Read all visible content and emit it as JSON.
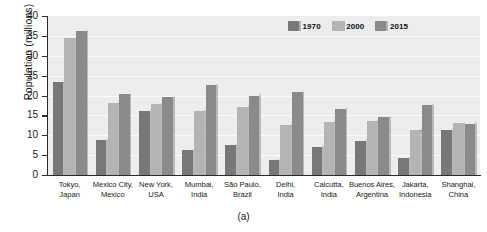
{
  "caption": "(a)",
  "colors": {
    "series_1970": "#787878",
    "series_2000": "#b4b4b4",
    "series_2015": "#8a8a8a",
    "plot_background": "#eceded",
    "gridline": "#fbfbfb",
    "axis": "#2a2a2a",
    "text": "#1a1a1a"
  },
  "chart_data": {
    "type": "bar",
    "title": "",
    "subtitle": "",
    "xlabel": "",
    "ylabel": "Population (millions)",
    "ylim": [
      0,
      40
    ],
    "yticks": [
      0,
      5,
      10,
      15,
      20,
      25,
      30,
      35,
      40
    ],
    "ytick_labels": [
      "0",
      "5",
      "10",
      "15",
      "20",
      "25",
      "30",
      "35",
      "40"
    ],
    "grid": true,
    "grid_axis": "y",
    "legend_position": "top-right",
    "categories": [
      "Tokyo,\nJapan",
      "Mexico City,\nMexico",
      "New York,\nUSA",
      "Mumbai,\nIndia",
      "São Paulo,\nBrazil",
      "Delhi,\nIndia",
      "Calcutta,\nIndia",
      "Buenos Aires,\nArgentina",
      "Jakarta,\nIndonesia",
      "Shanghai,\nChina"
    ],
    "category_lines": [
      [
        "Tokyo,",
        "Japan"
      ],
      [
        "Mexico City,",
        "Mexico"
      ],
      [
        "New York,",
        "USA"
      ],
      [
        "Mumbai,",
        "India"
      ],
      [
        "São Paulo,",
        "Brazil"
      ],
      [
        "Delhi,",
        "India"
      ],
      [
        "Calcutta,",
        "India"
      ],
      [
        "Buenos Aires,",
        "Argentina"
      ],
      [
        "Jakarta,",
        "Indonesia"
      ],
      [
        "Shanghai,",
        "China"
      ]
    ],
    "series": [
      {
        "name": "1970",
        "color": "#787878",
        "values": [
          23.3,
          8.8,
          16.2,
          6.3,
          7.6,
          3.7,
          7.1,
          8.6,
          4.2,
          11.4
        ]
      },
      {
        "name": "2000",
        "color": "#b4b4b4",
        "values": [
          34.4,
          18.0,
          17.8,
          16.1,
          17.2,
          12.5,
          13.3,
          13.5,
          11.2,
          13.1
        ]
      },
      {
        "name": "2015",
        "color": "#8a8a8a",
        "values": [
          36.2,
          20.4,
          19.6,
          22.6,
          20.0,
          20.9,
          16.7,
          14.6,
          17.6,
          12.9
        ]
      }
    ]
  }
}
